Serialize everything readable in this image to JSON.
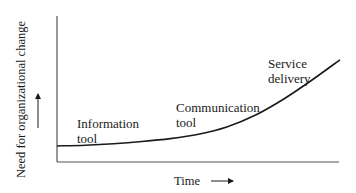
{
  "chart_data": {
    "type": "line",
    "title": "",
    "xlabel": "Time",
    "ylabel": "Need for organizational change",
    "x_arrow": "right-arrow",
    "y_arrow": "up-arrow",
    "grid": false,
    "legend": "none",
    "x": [
      0,
      0.1,
      0.2,
      0.3,
      0.4,
      0.5,
      0.6,
      0.7,
      0.8,
      0.9,
      1.0
    ],
    "series": [
      {
        "name": "Need for organizational change over time",
        "values": [
          0.11,
          0.115,
          0.125,
          0.14,
          0.16,
          0.19,
          0.24,
          0.32,
          0.43,
          0.56,
          0.7
        ]
      }
    ],
    "xlim": [
      0,
      1
    ],
    "ylim": [
      0,
      1
    ],
    "annotations": [
      {
        "lines": [
          "Information",
          "tool"
        ],
        "stage": 1
      },
      {
        "lines": [
          "Communication",
          "tool"
        ],
        "stage": 2
      },
      {
        "lines": [
          "Service",
          "delivery"
        ],
        "stage": 3
      }
    ]
  }
}
